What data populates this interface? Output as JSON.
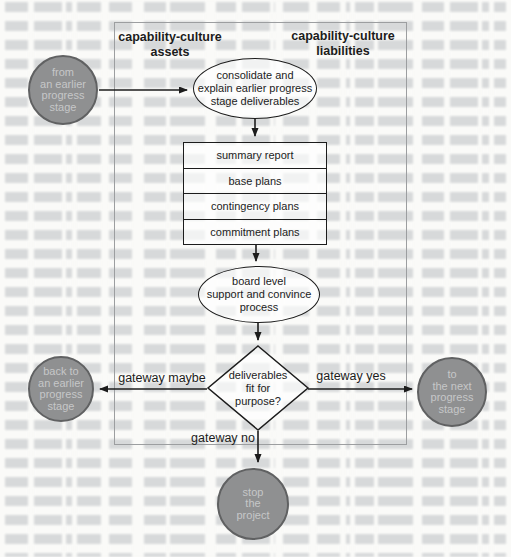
{
  "colors": {
    "page_bg": "#fafaf8",
    "bleed_ink": "#a9aeb3",
    "ink": "#1c1c1c",
    "box_border": "#9c9ea0",
    "shape_border": "#1c1c1c",
    "circle_fill": "#8f9091",
    "circle_border": "#606162",
    "circle_text": "#c6c7c8"
  },
  "diagram": {
    "headers": {
      "left": {
        "line1": "capability-culture",
        "line2": "assets"
      },
      "right": {
        "line1": "capability-culture",
        "line2": "liabilities"
      }
    },
    "nodes": {
      "from_stage": {
        "lines": [
          "from",
          "an earlier",
          "progress",
          "stage"
        ]
      },
      "consolidate": {
        "lines": [
          "consolidate and",
          "explain earlier progress",
          "stage deliverables"
        ]
      },
      "deliverables": {
        "rows": [
          "summary report",
          "base plans",
          "contingency plans",
          "commitment plans"
        ]
      },
      "board": {
        "lines": [
          "board level",
          "support and convince",
          "process"
        ]
      },
      "decision": {
        "lines": [
          "deliverables",
          "fit for",
          "purpose?"
        ]
      },
      "back_stage": {
        "lines": [
          "back to",
          "an earlier",
          "progress",
          "stage"
        ]
      },
      "next_stage": {
        "lines": [
          "to",
          "the next",
          "progress",
          "stage"
        ]
      },
      "stop": {
        "lines": [
          "stop",
          "the",
          "project"
        ]
      }
    },
    "gateway_labels": {
      "maybe": "gateway maybe",
      "yes": "gateway yes",
      "no": "gateway no"
    }
  }
}
